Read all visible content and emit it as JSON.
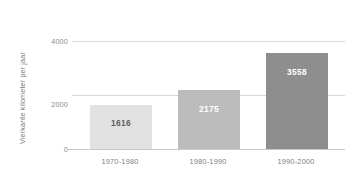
{
  "chart_data": {
    "type": "bar",
    "title": "",
    "xlabel": "",
    "ylabel": "Vierkante kilometer per jaar",
    "categories": [
      "1970-1980",
      "1980-1990",
      "1990-2000"
    ],
    "values": [
      1616,
      2175,
      3558
    ],
    "value_labels": [
      "1616",
      "2175",
      "3558"
    ],
    "ylim": [
      0,
      4000
    ],
    "yticks": [
      0,
      2000,
      4000
    ],
    "ytick_labels": [
      "0",
      "2000",
      "4000"
    ],
    "grid": true,
    "gridlines_at": [
      2000,
      4000
    ],
    "legend": null,
    "legend_position": "none",
    "bar_colors": [
      "#e2e2e2",
      "#bcbcbc",
      "#8e8e8e"
    ],
    "label_colors": [
      "#5f5f5f",
      "#ffffff",
      "#ffffff"
    ],
    "axis_text_color": "#7f7f7f",
    "gridline_color": "#d8d8d8",
    "background": "#ffffff"
  }
}
